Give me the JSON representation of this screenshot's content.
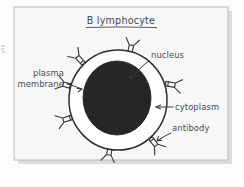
{
  "image": {
    "width": 244,
    "height": 187,
    "background_color": "#fdfdfd",
    "style": "hand-drawn biology diagram"
  },
  "frame": {
    "name": "diagram-frame",
    "x": 14,
    "y": 7,
    "width": 214,
    "height": 153,
    "fill_color": "#f7f7f7",
    "border_color": "#b9b9b9",
    "shadow_color": "#cfcfcf"
  },
  "title": {
    "text": "B lymphocyte",
    "underlined": true,
    "x": 121,
    "y": 24,
    "color": "#4a4a4a"
  },
  "cell": {
    "name": "b-lymphocyte-cell",
    "center_x": 118,
    "center_y": 100,
    "radius_x": 49,
    "radius_y": 50,
    "membrane_color": "#2e2e2e",
    "cytoplasm_color": "#ffffff"
  },
  "nucleus": {
    "name": "nucleus-shape",
    "center_x": 117,
    "center_y": 98,
    "radius_x": 34,
    "radius_y": 37,
    "fill_color": "#262626"
  },
  "antibodies": {
    "count": 7,
    "color": "#3a3a3a",
    "shape": "Y-shaped",
    "positions_deg": [
      76,
      128,
      160,
      196,
      255,
      300,
      340
    ]
  },
  "labels": [
    {
      "id": "nucleus",
      "name": "label-nucleus",
      "text": "nucleus",
      "lines": [
        "nucleus"
      ],
      "text_x": 151,
      "text_y": 58,
      "anchor": "start",
      "arrow_from_x": 150,
      "arrow_from_y": 62,
      "arrow_to_x": 131,
      "arrow_to_y": 79
    },
    {
      "id": "plasma-membrane",
      "name": "label-plasma-membrane",
      "text": "plasma membrane",
      "lines": [
        "plasma",
        "membrane"
      ],
      "text_x": 64,
      "text_y": 78,
      "anchor": "end",
      "arrow_from_x": 66,
      "arrow_from_y": 85,
      "arrow_to_x": 82,
      "arrow_to_y": 89
    },
    {
      "id": "cytoplasm",
      "name": "label-cytoplasm",
      "text": "cytoplasm",
      "lines": [
        "cytoplasm"
      ],
      "text_x": 175,
      "text_y": 110,
      "anchor": "start",
      "arrow_from_x": 173,
      "arrow_from_y": 107,
      "arrow_to_x": 155,
      "arrow_to_y": 107
    },
    {
      "id": "antibody",
      "name": "label-antibody",
      "text": "antibody",
      "lines": [
        "antibody"
      ],
      "text_x": 172,
      "text_y": 131,
      "anchor": "start",
      "arrow_from_x": 171,
      "arrow_from_y": 134,
      "arrow_to_x": 156,
      "arrow_to_y": 141
    }
  ],
  "colors": {
    "ink": "#3a3a3a",
    "nucleus_fill": "#262626",
    "paper": "#f7f7f7",
    "page": "#fdfdfd"
  }
}
